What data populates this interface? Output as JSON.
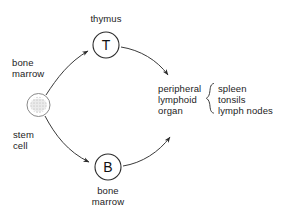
{
  "diagram": {
    "background_color": "#ffffff",
    "line_color": "#3a3a3a",
    "text_color": "#1c1c1c",
    "stem_cell": {
      "label_top": "bone\nmarrow",
      "label_bottom": "stem\ncell",
      "fill": "#d9d9d9",
      "stroke": "#777777"
    },
    "t_cell": {
      "letter": "T",
      "label_above": "thymus",
      "stroke": "#2b2b2b"
    },
    "b_cell": {
      "letter": "B",
      "label_below": "bone\nmarrow",
      "stroke": "#2b2b2b"
    },
    "destination": {
      "left_text": "peripheral\nlymphoid\norgan",
      "brace_glyph": "{",
      "right_text": "spleen\ntonsils\nlymph nodes"
    },
    "arrows": [
      {
        "name": "stem-to-t",
        "from": "stem cell",
        "to": "T"
      },
      {
        "name": "stem-to-b",
        "from": "stem cell",
        "to": "B"
      },
      {
        "name": "t-to-peripheral",
        "from": "T",
        "to": "peripheral lymphoid organ"
      },
      {
        "name": "b-to-peripheral",
        "from": "B",
        "to": "peripheral lymphoid organ"
      }
    ]
  }
}
